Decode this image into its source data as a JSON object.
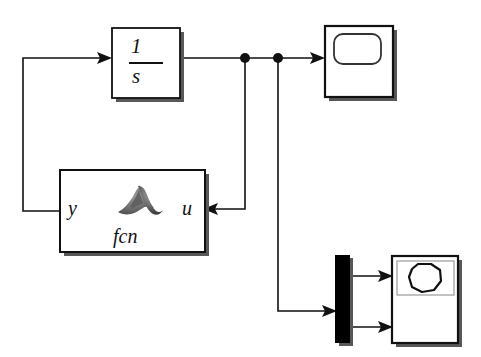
{
  "diagram": {
    "kind": "simulink-block-diagram",
    "background_color": "#ffffff",
    "line_color": "#111111",
    "blocks": {
      "integrator": {
        "type": "integrator-block",
        "numerator": "1",
        "denominator": "s",
        "transfer_function": "1/s"
      },
      "matlab_function": {
        "type": "matlab-function-block",
        "input_port_label": "y",
        "output_port_label": "u",
        "name_label": "fcn",
        "icon": "matlab-membrane-logo"
      },
      "scope": {
        "type": "scope-block",
        "icon": "scope-screen-icon"
      },
      "mux": {
        "type": "mux-block",
        "fill_color": "#000000"
      },
      "xy_graph": {
        "type": "xy-graph-block",
        "icon": "xy-circle-trace-icon"
      }
    },
    "signals": {
      "junction_count": "2",
      "arrowheads": "5"
    }
  }
}
